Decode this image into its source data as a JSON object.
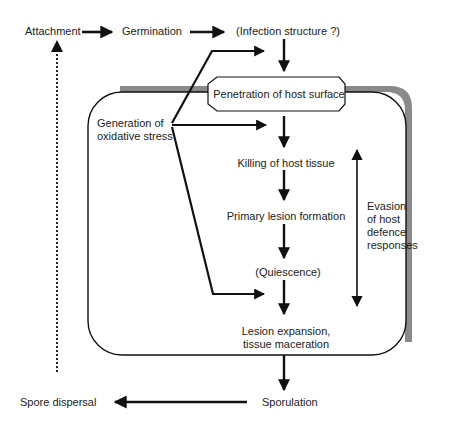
{
  "diagram": {
    "title": "",
    "colors": {
      "line": "#111111",
      "text": "#222222",
      "shadow": "#8a8a8a",
      "background": "#ffffff"
    },
    "nodes": {
      "attachment": "Attachment",
      "germination": "Germination",
      "infection_structure": "(Infection structure ?)",
      "penetration": "Penetration of host surface",
      "oxidative_stress": "Generation of\noxidative stress",
      "killing": "Killing of host tissue",
      "primary_lesion": "Primary lesion formation",
      "quiescence": "(Quiescence)",
      "lesion_expansion": "Lesion expansion,\ntissue maceration",
      "sporulation": "Sporulation",
      "spore_dispersal": "Spore dispersal",
      "evasion": "Evasion\nof host\ndefence\nresponses"
    },
    "edges": [
      {
        "from": "Attachment",
        "to": "Germination",
        "style": "solid"
      },
      {
        "from": "Germination",
        "to": "(Infection structure ?)",
        "style": "solid"
      },
      {
        "from": "(Infection structure ?)",
        "to": "Penetration of host surface",
        "style": "solid"
      },
      {
        "from": "Penetration of host surface",
        "to": "Killing of host tissue",
        "style": "solid"
      },
      {
        "from": "Killing of host tissue",
        "to": "Primary lesion formation",
        "style": "solid"
      },
      {
        "from": "Primary lesion formation",
        "to": "(Quiescence)",
        "style": "solid"
      },
      {
        "from": "(Quiescence)",
        "to": "Lesion expansion, tissue maceration",
        "style": "solid"
      },
      {
        "from": "Lesion expansion, tissue maceration",
        "to": "Sporulation",
        "style": "solid"
      },
      {
        "from": "Sporulation",
        "to": "Spore dispersal",
        "style": "solid"
      },
      {
        "from": "Spore dispersal",
        "to": "Attachment",
        "style": "dotted"
      },
      {
        "from": "Generation of oxidative stress",
        "to": "(Infection structure ?)",
        "style": "solid"
      },
      {
        "from": "Generation of oxidative stress",
        "to": "Killing of host tissue",
        "style": "solid"
      },
      {
        "from": "Generation of oxidative stress",
        "to": "Lesion expansion, tissue maceration",
        "style": "solid"
      },
      {
        "from": "Evasion of host defence responses",
        "to": "Penetration through Lesion expansion",
        "style": "double-headed"
      }
    ]
  }
}
